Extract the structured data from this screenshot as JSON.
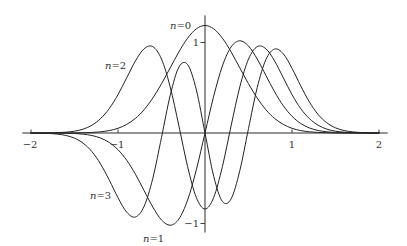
{
  "chart_data": {
    "type": "line",
    "title": "",
    "xlabel": "",
    "ylabel": "",
    "xlim": [
      -2.1,
      2.1
    ],
    "ylim": [
      -1.1,
      1.3
    ],
    "grid": false,
    "legend": null,
    "xticks": [
      -2,
      -1,
      1,
      2
    ],
    "xtick_labels": [
      "−2",
      "−1",
      "1",
      "2"
    ],
    "yticks": [
      1,
      -1
    ],
    "ytick_labels": [
      "1",
      "−1"
    ],
    "x": [
      -2.0,
      -1.9,
      -1.8,
      -1.7,
      -1.6,
      -1.5,
      -1.4,
      -1.3,
      -1.2,
      -1.1,
      -1.0,
      -0.9,
      -0.8,
      -0.7,
      -0.6,
      -0.5,
      -0.4,
      -0.3,
      -0.2,
      -0.1,
      0.0,
      0.1,
      0.2,
      0.3,
      0.4,
      0.5,
      0.6,
      0.7,
      0.8,
      0.9,
      1.0,
      1.1,
      1.2,
      1.3,
      1.4,
      1.5,
      1.6,
      1.7,
      1.8,
      1.9,
      2.0
    ],
    "series": [
      {
        "name": "n=0",
        "values": [
          0,
          0,
          0,
          0,
          0,
          0.001,
          0.003,
          0.006,
          0.013,
          0.027,
          0.052,
          0.095,
          0.161,
          0.257,
          0.386,
          0.544,
          0.72,
          0.896,
          1.048,
          1.151,
          1.188,
          1.151,
          1.048,
          0.896,
          0.72,
          0.544,
          0.386,
          0.257,
          0.161,
          0.095,
          0.052,
          0.027,
          0.013,
          0.006,
          0.003,
          0.001,
          0,
          0,
          0,
          0,
          0
        ]
      },
      {
        "name": "n=1",
        "values": [
          0,
          0,
          0,
          -0.001,
          -0.002,
          -0.006,
          -0.013,
          -0.028,
          -0.056,
          -0.105,
          -0.185,
          -0.301,
          -0.455,
          -0.636,
          -0.818,
          -0.961,
          -1.019,
          -0.951,
          -0.741,
          -0.407,
          0,
          0.407,
          0.741,
          0.951,
          1.019,
          0.961,
          0.818,
          0.636,
          0.455,
          0.301,
          0.185,
          0.105,
          0.056,
          0.028,
          0.013,
          0.006,
          0.002,
          0.001,
          0,
          0,
          0
        ]
      },
      {
        "name": "n=2",
        "values": [
          0,
          0,
          0.001,
          0.004,
          0.009,
          0.02,
          0.043,
          0.086,
          0.159,
          0.27,
          0.424,
          0.61,
          0.796,
          0.931,
          0.954,
          0.817,
          0.509,
          0.079,
          -0.371,
          -0.712,
          -0.84,
          -0.712,
          -0.371,
          0.079,
          0.509,
          0.817,
          0.954,
          0.931,
          0.796,
          0.61,
          0.424,
          0.27,
          0.159,
          0.086,
          0.043,
          0.02,
          0.009,
          0.004,
          0.001,
          0,
          0
        ]
      },
      {
        "name": "n=3",
        "values": [
          -0.001,
          -0.002,
          -0.005,
          -0.012,
          -0.027,
          -0.057,
          -0.113,
          -0.205,
          -0.343,
          -0.521,
          -0.715,
          -0.875,
          -0.928,
          -0.811,
          -0.501,
          -0.049,
          0.416,
          0.728,
          0.756,
          0.478,
          0,
          -0.478,
          -0.756,
          -0.728,
          -0.416,
          0.049,
          0.501,
          0.811,
          0.928,
          0.875,
          0.715,
          0.521,
          0.343,
          0.205,
          0.113,
          0.057,
          0.027,
          0.012,
          0.005,
          0.002,
          0.001
        ]
      }
    ],
    "annotations": [
      {
        "text": "n=0",
        "series": "n=0"
      },
      {
        "text": "n=2",
        "series": "n=2"
      },
      {
        "text": "n=3",
        "series": "n=3"
      },
      {
        "text": "n=1",
        "series": "n=1"
      }
    ]
  }
}
